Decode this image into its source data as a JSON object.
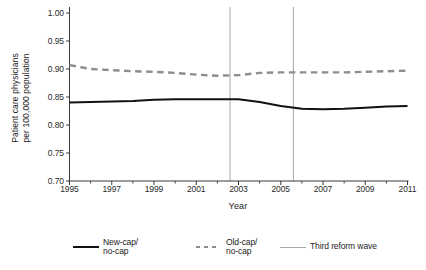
{
  "chart_data": {
    "type": "line",
    "title": "",
    "xlabel": "Year",
    "ylabel_line1": "Patient care physicians",
    "ylabel_line2": "per 100,000 population",
    "xlim": [
      1995,
      2011
    ],
    "ylim": [
      0.7,
      1.0
    ],
    "grid": false,
    "legend_position": "below",
    "yticks": [
      "1.00",
      "0.95",
      "0.90",
      "0.85",
      "0.80",
      "0.75",
      "0.70"
    ],
    "ytick_values": [
      1.0,
      0.95,
      0.9,
      0.85,
      0.8,
      0.75,
      0.7
    ],
    "xticks": [
      "1995",
      "1997",
      "1999",
      "2001",
      "2003",
      "2005",
      "2007",
      "2009",
      "2011"
    ],
    "xtick_values": [
      1995,
      1997,
      1999,
      2001,
      2003,
      2005,
      2007,
      2009,
      2011
    ],
    "x": [
      1995,
      1996,
      1997,
      1998,
      1999,
      2000,
      2001,
      2002,
      2003,
      2004,
      2005,
      2006,
      2007,
      2008,
      2009,
      2010,
      2011
    ],
    "series": [
      {
        "name": "New-cap/ no-cap",
        "style": "solid",
        "color": "#111111",
        "values": [
          0.84,
          0.841,
          0.842,
          0.843,
          0.845,
          0.846,
          0.846,
          0.846,
          0.846,
          0.841,
          0.834,
          0.829,
          0.828,
          0.829,
          0.831,
          0.833,
          0.834
        ]
      },
      {
        "name": "Old-cap/ no-cap",
        "style": "dashed",
        "color": "#8d8d8d",
        "values": [
          0.907,
          0.9,
          0.898,
          0.896,
          0.895,
          0.893,
          0.89,
          0.888,
          0.889,
          0.893,
          0.894,
          0.894,
          0.894,
          0.894,
          0.895,
          0.896,
          0.897
        ]
      }
    ],
    "vlines": {
      "name": "Third reform wave",
      "color": "#a8a8a8",
      "values": [
        2002.6,
        2005.6
      ]
    }
  },
  "legend": {
    "entries": [
      {
        "label_line1": "New-cap/",
        "label_line2": "no-cap",
        "style": "solid"
      },
      {
        "label_line1": "Old-cap/",
        "label_line2": "no-cap",
        "style": "dashed"
      },
      {
        "label_line1": "Third reform wave",
        "label_line2": "",
        "style": "thin"
      }
    ]
  }
}
